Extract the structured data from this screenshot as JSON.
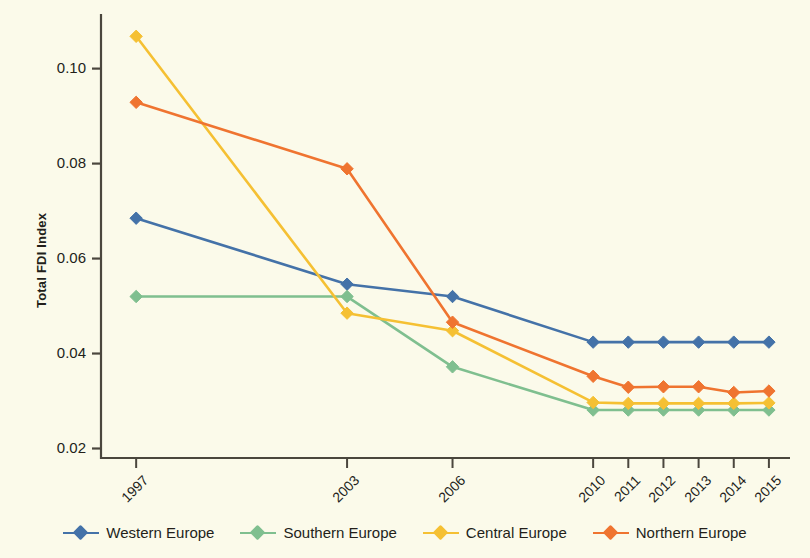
{
  "chart_data": {
    "type": "line",
    "title": "",
    "xlabel": "",
    "ylabel": "Total FDI Index",
    "categories": [
      "1997",
      "2003",
      "2006",
      "2010",
      "2011",
      "2012",
      "2013",
      "2014",
      "2015"
    ],
    "x": [
      1997,
      2003,
      2006,
      2010,
      2011,
      2012,
      2013,
      2014,
      2015
    ],
    "xlim": [
      1996.0,
      2015.6
    ],
    "ylim": [
      0.018,
      0.1115
    ],
    "yticks": [
      0.02,
      0.04,
      0.06,
      0.08,
      0.1
    ],
    "ytick_labels": [
      "0.02",
      "0.04",
      "0.06",
      "0.08",
      "0.10"
    ],
    "grid": false,
    "legend_position": "bottom",
    "marker": "diamond",
    "series": [
      {
        "name": "Western Europe",
        "color": "#4472a8",
        "values": [
          0.0685,
          0.0546,
          0.052,
          0.0424,
          0.0424,
          0.0424,
          0.0424,
          0.0424,
          0.0424
        ]
      },
      {
        "name": "Southern Europe",
        "color": "#7fbf8f",
        "values": [
          0.052,
          0.052,
          0.0372,
          0.0281,
          0.0281,
          0.0281,
          0.0281,
          0.0281,
          0.0281
        ]
      },
      {
        "name": "Central Europe",
        "color": "#f5c033",
        "values": [
          0.1068,
          0.0485,
          0.0448,
          0.0297,
          0.0295,
          0.0295,
          0.0295,
          0.0295,
          0.0296
        ]
      },
      {
        "name": "Northern Europe",
        "color": "#ef7430",
        "values": [
          0.0929,
          0.0789,
          0.0466,
          0.0352,
          0.0329,
          0.033,
          0.033,
          0.0318,
          0.0321
        ]
      }
    ]
  },
  "legend": {
    "items": [
      {
        "label": "Western Europe",
        "color": "#4472a8"
      },
      {
        "label": "Southern Europe",
        "color": "#7fbf8f"
      },
      {
        "label": "Central Europe",
        "color": "#f5c033"
      },
      {
        "label": "Northern Europe",
        "color": "#ef7430"
      }
    ]
  },
  "style": {
    "background": "#fbfaea",
    "axis_color": "#4a463d",
    "text_color": "#231f1a"
  }
}
